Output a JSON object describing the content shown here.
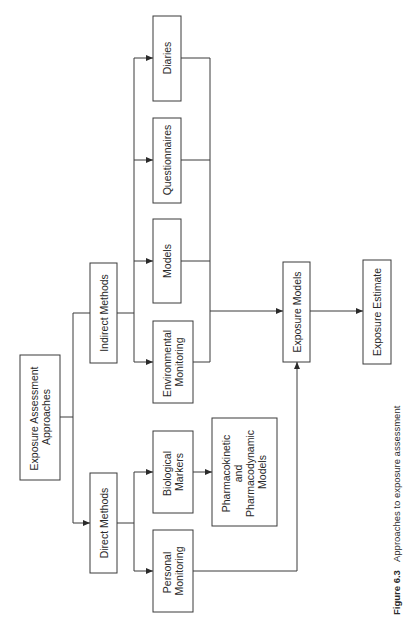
{
  "diagram": {
    "title": "Approaches to exposure assessment",
    "orientation": "rotated -90deg (reads bottom-to-top)",
    "nodes": {
      "root": {
        "lines": [
          "Exposure Assessment",
          "Approaches"
        ]
      },
      "direct": {
        "lines": [
          "Direct Methods"
        ]
      },
      "indirect": {
        "lines": [
          "Indirect Methods"
        ]
      },
      "personal": {
        "lines": [
          "Personal",
          "Monitoring"
        ]
      },
      "biological": {
        "lines": [
          "Biological",
          "Markers"
        ]
      },
      "pkpd": {
        "lines": [
          "Pharmacokinetic",
          "and",
          "Pharmacodynamic",
          "Models"
        ]
      },
      "environmental": {
        "lines": [
          "Environmental",
          "Monitoring"
        ]
      },
      "models": {
        "lines": [
          "Models"
        ]
      },
      "questionnaires": {
        "lines": [
          "Questionnaires"
        ]
      },
      "diaries": {
        "lines": [
          "Diaries"
        ]
      },
      "exposure_models": {
        "lines": [
          "Exposure Models"
        ]
      },
      "exposure_estimate": {
        "lines": [
          "Exposure Estimate"
        ]
      }
    },
    "edges": [
      [
        "Exposure Assessment Approaches",
        "Direct Methods"
      ],
      [
        "Exposure Assessment Approaches",
        "Indirect Methods"
      ],
      [
        "Direct Methods",
        "Personal Monitoring"
      ],
      [
        "Direct Methods",
        "Biological Markers"
      ],
      [
        "Biological Markers",
        "Pharmacokinetic and Pharmacodynamic Models"
      ],
      [
        "Indirect Methods",
        "Environmental Monitoring"
      ],
      [
        "Indirect Methods",
        "Models"
      ],
      [
        "Indirect Methods",
        "Questionnaires"
      ],
      [
        "Indirect Methods",
        "Diaries"
      ],
      [
        "Environmental Monitoring",
        "Exposure Models"
      ],
      [
        "Models",
        "Exposure Models"
      ],
      [
        "Questionnaires",
        "Exposure Models"
      ],
      [
        "Diaries",
        "Exposure Models"
      ],
      [
        "Personal Monitoring",
        "Exposure Models"
      ],
      [
        "Exposure Models",
        "Exposure Estimate"
      ]
    ]
  },
  "caption": {
    "label": "Figure 6.3",
    "text": "Approaches to exposure assessment"
  }
}
